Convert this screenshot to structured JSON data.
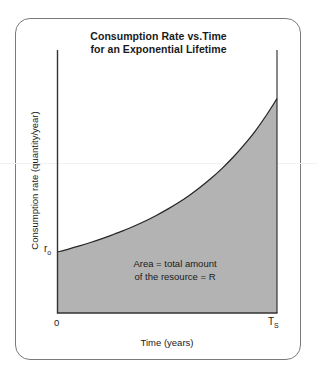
{
  "figure": {
    "title_line1": "Consumption Rate vs.Time",
    "title_line2": "for an Exponential Lifetime",
    "frame_color": "#7a7a7a",
    "background_color": "#ffffff"
  },
  "axes": {
    "y_label": "Consumption rate (quantity/year)",
    "x_label": "Time (years)",
    "x_tick_left": "0",
    "x_tick_right_base": "T",
    "x_tick_right_sub": "S",
    "y_tick_base": "r",
    "y_tick_sub": "o",
    "axis_color": "#333333"
  },
  "annotation": {
    "line1": "Area = total amount",
    "line2": "of the resource = R"
  },
  "chart_data": {
    "type": "area",
    "title": "Consumption Rate vs.Time for an Exponential Lifetime",
    "xlabel": "Time (years)",
    "ylabel": "Consumption rate (quantity/year)",
    "xlim": [
      0,
      1
    ],
    "ylim": [
      0,
      1
    ],
    "x_tick_labels": [
      "0",
      "T_S"
    ],
    "x_tick_values": [
      0,
      1
    ],
    "y_tick_labels": [
      "r_o"
    ],
    "y_tick_values": [
      0.232
    ],
    "grid": false,
    "legend": false,
    "fill_color": "#b3b3b3",
    "line_color": "#262626",
    "series": [
      {
        "name": "consumption rate r(t) = r_o * exp(k t)",
        "description": "Exponentially growing consumption rate; shaded area under the curve from 0 to T_S equals total resource R",
        "x": [
          0.0,
          0.05,
          0.1,
          0.15,
          0.2,
          0.25,
          0.3,
          0.35,
          0.4,
          0.45,
          0.5,
          0.55,
          0.6,
          0.65,
          0.7,
          0.75,
          0.8,
          0.85,
          0.9,
          0.95,
          1.0
        ],
        "y": [
          0.232,
          0.243,
          0.255,
          0.268,
          0.282,
          0.297,
          0.313,
          0.331,
          0.35,
          0.371,
          0.394,
          0.419,
          0.447,
          0.478,
          0.512,
          0.55,
          0.592,
          0.639,
          0.691,
          0.75,
          0.815
        ]
      }
    ],
    "annotations": [
      {
        "text": "Area = total amount of the resource = R",
        "x": 0.42,
        "y": 0.1
      }
    ]
  }
}
